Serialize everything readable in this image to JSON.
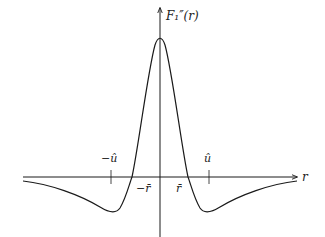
{
  "diagram": {
    "type": "function-plot",
    "y_axis_label": "F₁″(r)",
    "x_axis_label": "r",
    "tick_labels": {
      "neg_u_hat": "−û",
      "u_hat": "û",
      "neg_r_bar": "−r̄",
      "r_bar": "r̄"
    },
    "curve_description": "Even function with a sharp positive peak at r=0, crossing zero at ±r̄, with negative minima near ±û and approaching 0 from below as |r| grows",
    "colors": {
      "stroke": "#1a1a1a",
      "background": "#ffffff"
    }
  }
}
